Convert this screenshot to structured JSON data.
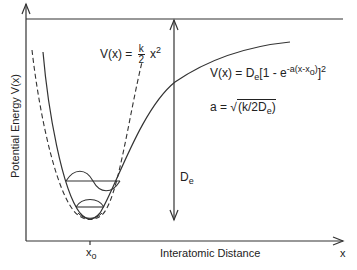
{
  "diagram": {
    "y_axis_label": "Potential Energy  V(x)",
    "x_axis_label": "Interatomic  Distance",
    "x_axis_variable": "x",
    "x_tick_label": "x",
    "x_tick_subscript": "o",
    "harmonic_label": {
      "lhs": "V(x)  =",
      "frac_num": "k",
      "frac_den": "2",
      "rhs": "x",
      "power": "2"
    },
    "morse_label": {
      "lhs": "V(x)  =  D",
      "sub_e": "e",
      "bracket_open": "[1  -  e",
      "exponent": "-a(x-x",
      "exp_sub": "o",
      "exp_close": ")",
      "bracket_close": "]",
      "power": "2"
    },
    "a_label": {
      "lhs": "a  =",
      "sqrt_content": "(k/2D",
      "sub_e": "e",
      "close": ")"
    },
    "de_label": {
      "text": "D",
      "sub": "e"
    },
    "curves": [
      {
        "name": "Morse potential",
        "style": "solid"
      },
      {
        "name": "Harmonic potential",
        "style": "dashed"
      }
    ],
    "energy_levels": [
      {
        "level": 0,
        "wavefunction": "gaussian"
      },
      {
        "level": 1,
        "wavefunction": "one-node"
      }
    ]
  }
}
